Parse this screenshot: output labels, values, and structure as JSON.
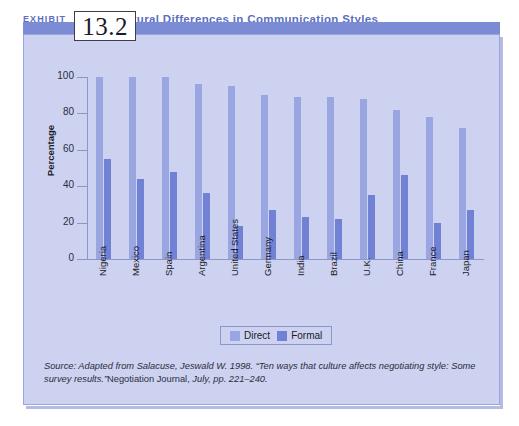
{
  "header": {
    "exhibit_word": "EXHIBIT",
    "exhibit_number": "13.2",
    "title": "Cultural Differences in Communication Styles"
  },
  "legend": {
    "items": [
      {
        "label": "Direct",
        "color": "#9aa6e2"
      },
      {
        "label": "Formal",
        "color": "#7182d4"
      }
    ]
  },
  "source": {
    "line1_italic": "Source: Adapted from Salacuse, Jeswald W. 1998. “Ten ways that culture affects negotiating style:",
    "line2_italic_a": "Some survey results.”",
    "line2_roman": "Negotiation Journal,",
    "line2_italic_b": " July, pp. 221–240."
  },
  "colors": {
    "panel_bg": "#ccd2ef",
    "banner": "#7b8cd4",
    "title_text": "#5b6fc0",
    "direct": "#9aa6e2",
    "formal": "#7182d4",
    "axis": "#8e96c9"
  },
  "chart_data": {
    "type": "bar",
    "title": "Cultural Differences in Communication Styles",
    "xlabel": "",
    "ylabel": "Percentage",
    "ylim": [
      0,
      100
    ],
    "yticks": [
      0,
      20,
      40,
      60,
      80,
      100
    ],
    "grid": false,
    "legend_position": "bottom-center",
    "categories": [
      "Nigeria",
      "Mexico",
      "Spain",
      "Argentina",
      "United States",
      "Germany",
      "India",
      "Brazil",
      "U.K.",
      "China",
      "France",
      "Japan"
    ],
    "series": [
      {
        "name": "Direct",
        "color": "#9aa6e2",
        "values": [
          100,
          100,
          100,
          96,
          95,
          90,
          89,
          89,
          88,
          82,
          78,
          72
        ]
      },
      {
        "name": "Formal",
        "color": "#7182d4",
        "values": [
          55,
          44,
          48,
          36,
          18,
          27,
          23,
          22,
          35,
          46,
          20,
          27
        ]
      }
    ]
  }
}
